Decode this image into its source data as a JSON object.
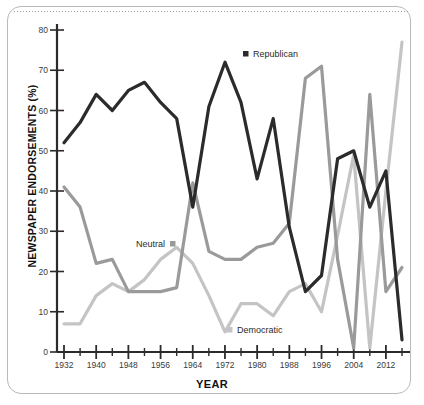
{
  "chart_data": {
    "type": "line",
    "title": "",
    "xlabel": "YEAR",
    "ylabel": "NEWSPAPER ENDORSEMENTS (%)",
    "xlim": [
      1932,
      2016
    ],
    "ylim": [
      0,
      80
    ],
    "grid": false,
    "legend_position": "inline-annotations",
    "x_major_ticks": [
      1932,
      1940,
      1948,
      1956,
      1964,
      1972,
      1980,
      1988,
      1996,
      2004,
      2012
    ],
    "x_minor_ticks": [
      1936,
      1944,
      1952,
      1960,
      1968,
      1976,
      1984,
      1992,
      2000,
      2008,
      2016
    ],
    "y_ticks": [
      0,
      10,
      20,
      30,
      40,
      50,
      60,
      70,
      80
    ],
    "x": [
      1932,
      1936,
      1940,
      1944,
      1948,
      1952,
      1956,
      1960,
      1964,
      1968,
      1972,
      1976,
      1980,
      1984,
      1988,
      1992,
      1996,
      2000,
      2004,
      2008,
      2012,
      2016
    ],
    "series": [
      {
        "name": "Republican",
        "color": "#2b2b2b",
        "values": [
          52,
          57,
          64,
          60,
          65,
          67,
          62,
          58,
          36,
          61,
          72,
          62,
          43,
          58,
          31,
          15,
          19,
          48,
          50,
          36,
          45,
          3
        ]
      },
      {
        "name": "Neutral",
        "color": "#9a9a9a",
        "values": [
          41,
          36,
          22,
          23,
          15,
          15,
          15,
          16,
          42,
          25,
          23,
          23,
          26,
          27,
          32,
          68,
          71,
          23,
          1,
          64,
          15,
          21
        ]
      },
      {
        "name": "Democratic",
        "color": "#c4c4c4",
        "values": [
          7,
          7,
          14,
          17,
          15,
          18,
          23,
          26,
          22,
          14,
          5,
          12,
          12,
          9,
          15,
          17,
          10,
          29,
          49,
          1,
          40,
          77
        ]
      }
    ],
    "annotations": [
      {
        "label": "Republican",
        "marker_side": "left",
        "color": "#2b2b2b",
        "x_px": 243,
        "y_px": 55
      },
      {
        "label": "Neutral",
        "marker_side": "right",
        "color": "#9a9a9a",
        "x_px": 165,
        "y_px": 245
      },
      {
        "label": "Democratic",
        "marker_side": "left",
        "color": "#c4c4c4",
        "x_px": 227,
        "y_px": 331
      }
    ]
  }
}
